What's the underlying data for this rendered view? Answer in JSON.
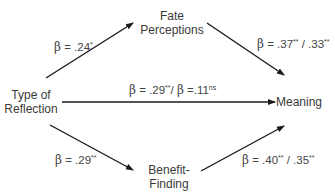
{
  "nodes": {
    "predictor": {
      "line1": "Type of",
      "line2": "Reflection"
    },
    "mediator_top": {
      "line1": "Fate",
      "line2": "Perceptions"
    },
    "mediator_bottom": {
      "line1": "Benefit-",
      "line2": "Finding"
    },
    "outcome": {
      "line1": "Meaning"
    }
  },
  "paths": {
    "a_top": {
      "beta_symbol": "β",
      "text": " = .24",
      "sig": "*"
    },
    "b_top": {
      "beta_symbol": "β",
      "text1": " = .37",
      "sig1": "**",
      "text2": " / .33",
      "sig2": "**"
    },
    "direct": {
      "beta_symbol": "β",
      "text1": " = .29",
      "sig1": "**",
      "sep": "/ ",
      "beta_symbol2": "β",
      "text2": " =.11",
      "sig2": "ns"
    },
    "a_bottom": {
      "beta_symbol": "β",
      "text": " = .29",
      "sig": "**"
    },
    "b_bottom": {
      "beta_symbol": "β",
      "text1": " = .40",
      "sig1": "**",
      "text2": " / .35",
      "sig2": "**"
    }
  },
  "colors": {
    "arrow": "#1a1a1a",
    "text": "#3a3a3a"
  }
}
